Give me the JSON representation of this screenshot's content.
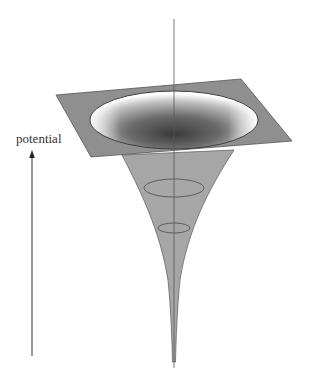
{
  "diagram": {
    "type": "potential-well-funnel",
    "axis_label": "potential",
    "colors": {
      "plane_fill": "#8f8f8f",
      "plane_stroke": "#555555",
      "funnel_fill": "#a6a6a6",
      "funnel_stroke": "#666666",
      "well_dark": "#3a3a3a",
      "well_light": "#ffffff",
      "axis_line": "#555555",
      "arrow": "#333333"
    },
    "rings": [
      {
        "cx": 174,
        "cy": 188,
        "rx": 30,
        "ry": 9
      },
      {
        "cx": 174,
        "cy": 228,
        "rx": 16,
        "ry": 5
      }
    ]
  }
}
